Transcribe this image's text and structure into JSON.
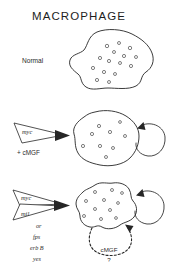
{
  "figure": {
    "title": "MACROPHAGE",
    "background_color": "#ffffff",
    "ink_color": "#262626"
  },
  "rows": [
    {
      "id": "normal",
      "label": "Normal",
      "cell": {
        "name": "normal-macrophage",
        "granule_count": 14,
        "has_autocrine_arrow": false,
        "has_dashed_loop": false
      },
      "wedges": [],
      "caption": "",
      "extra_genes": []
    },
    {
      "id": "myc-cmgf",
      "label": "",
      "cell": {
        "name": "myc-cmgf-macrophage",
        "granule_count": 9,
        "has_autocrine_arrow": true,
        "has_dashed_loop": false
      },
      "wedges": [
        {
          "label": "myc"
        }
      ],
      "caption": "+ cMGF",
      "extra_genes": []
    },
    {
      "id": "myc-mil",
      "label": "",
      "cell": {
        "name": "myc-mil-macrophage",
        "granule_count": 11,
        "has_autocrine_arrow": true,
        "has_dashed_loop": true
      },
      "wedges": [
        {
          "label": "myc"
        },
        {
          "label": "mil"
        }
      ],
      "caption": "",
      "extra_genes": [
        "or",
        "fps",
        "erb B",
        "yes"
      ],
      "loop": {
        "label": "cMGF",
        "question_mark": "?"
      }
    }
  ]
}
